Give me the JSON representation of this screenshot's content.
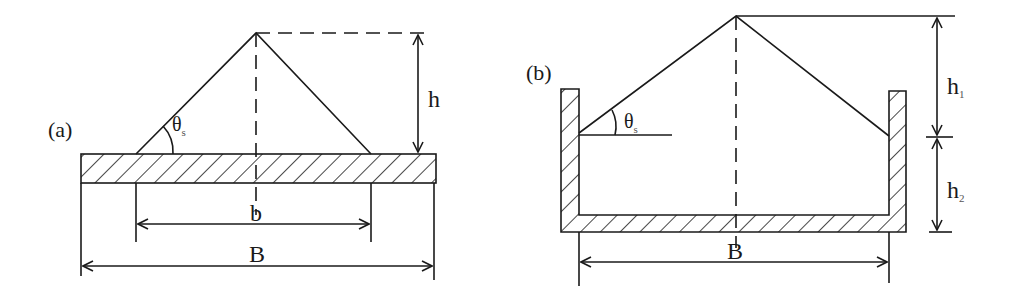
{
  "figure": {
    "panel_a": {
      "label": "(a)",
      "angle_symbol": "θ",
      "angle_subscript": "s",
      "height_label": "h",
      "base_width_label": "b",
      "plate_width_label": "B"
    },
    "panel_b": {
      "label": "(b)",
      "angle_symbol": "θ",
      "angle_subscript": "s",
      "upper_height_label": "h",
      "upper_height_subscript": "1",
      "lower_height_label": "h",
      "lower_height_subscript": "2",
      "width_label": "B"
    },
    "colors": {
      "line": "#1a1a1a",
      "background": "#ffffff"
    }
  }
}
